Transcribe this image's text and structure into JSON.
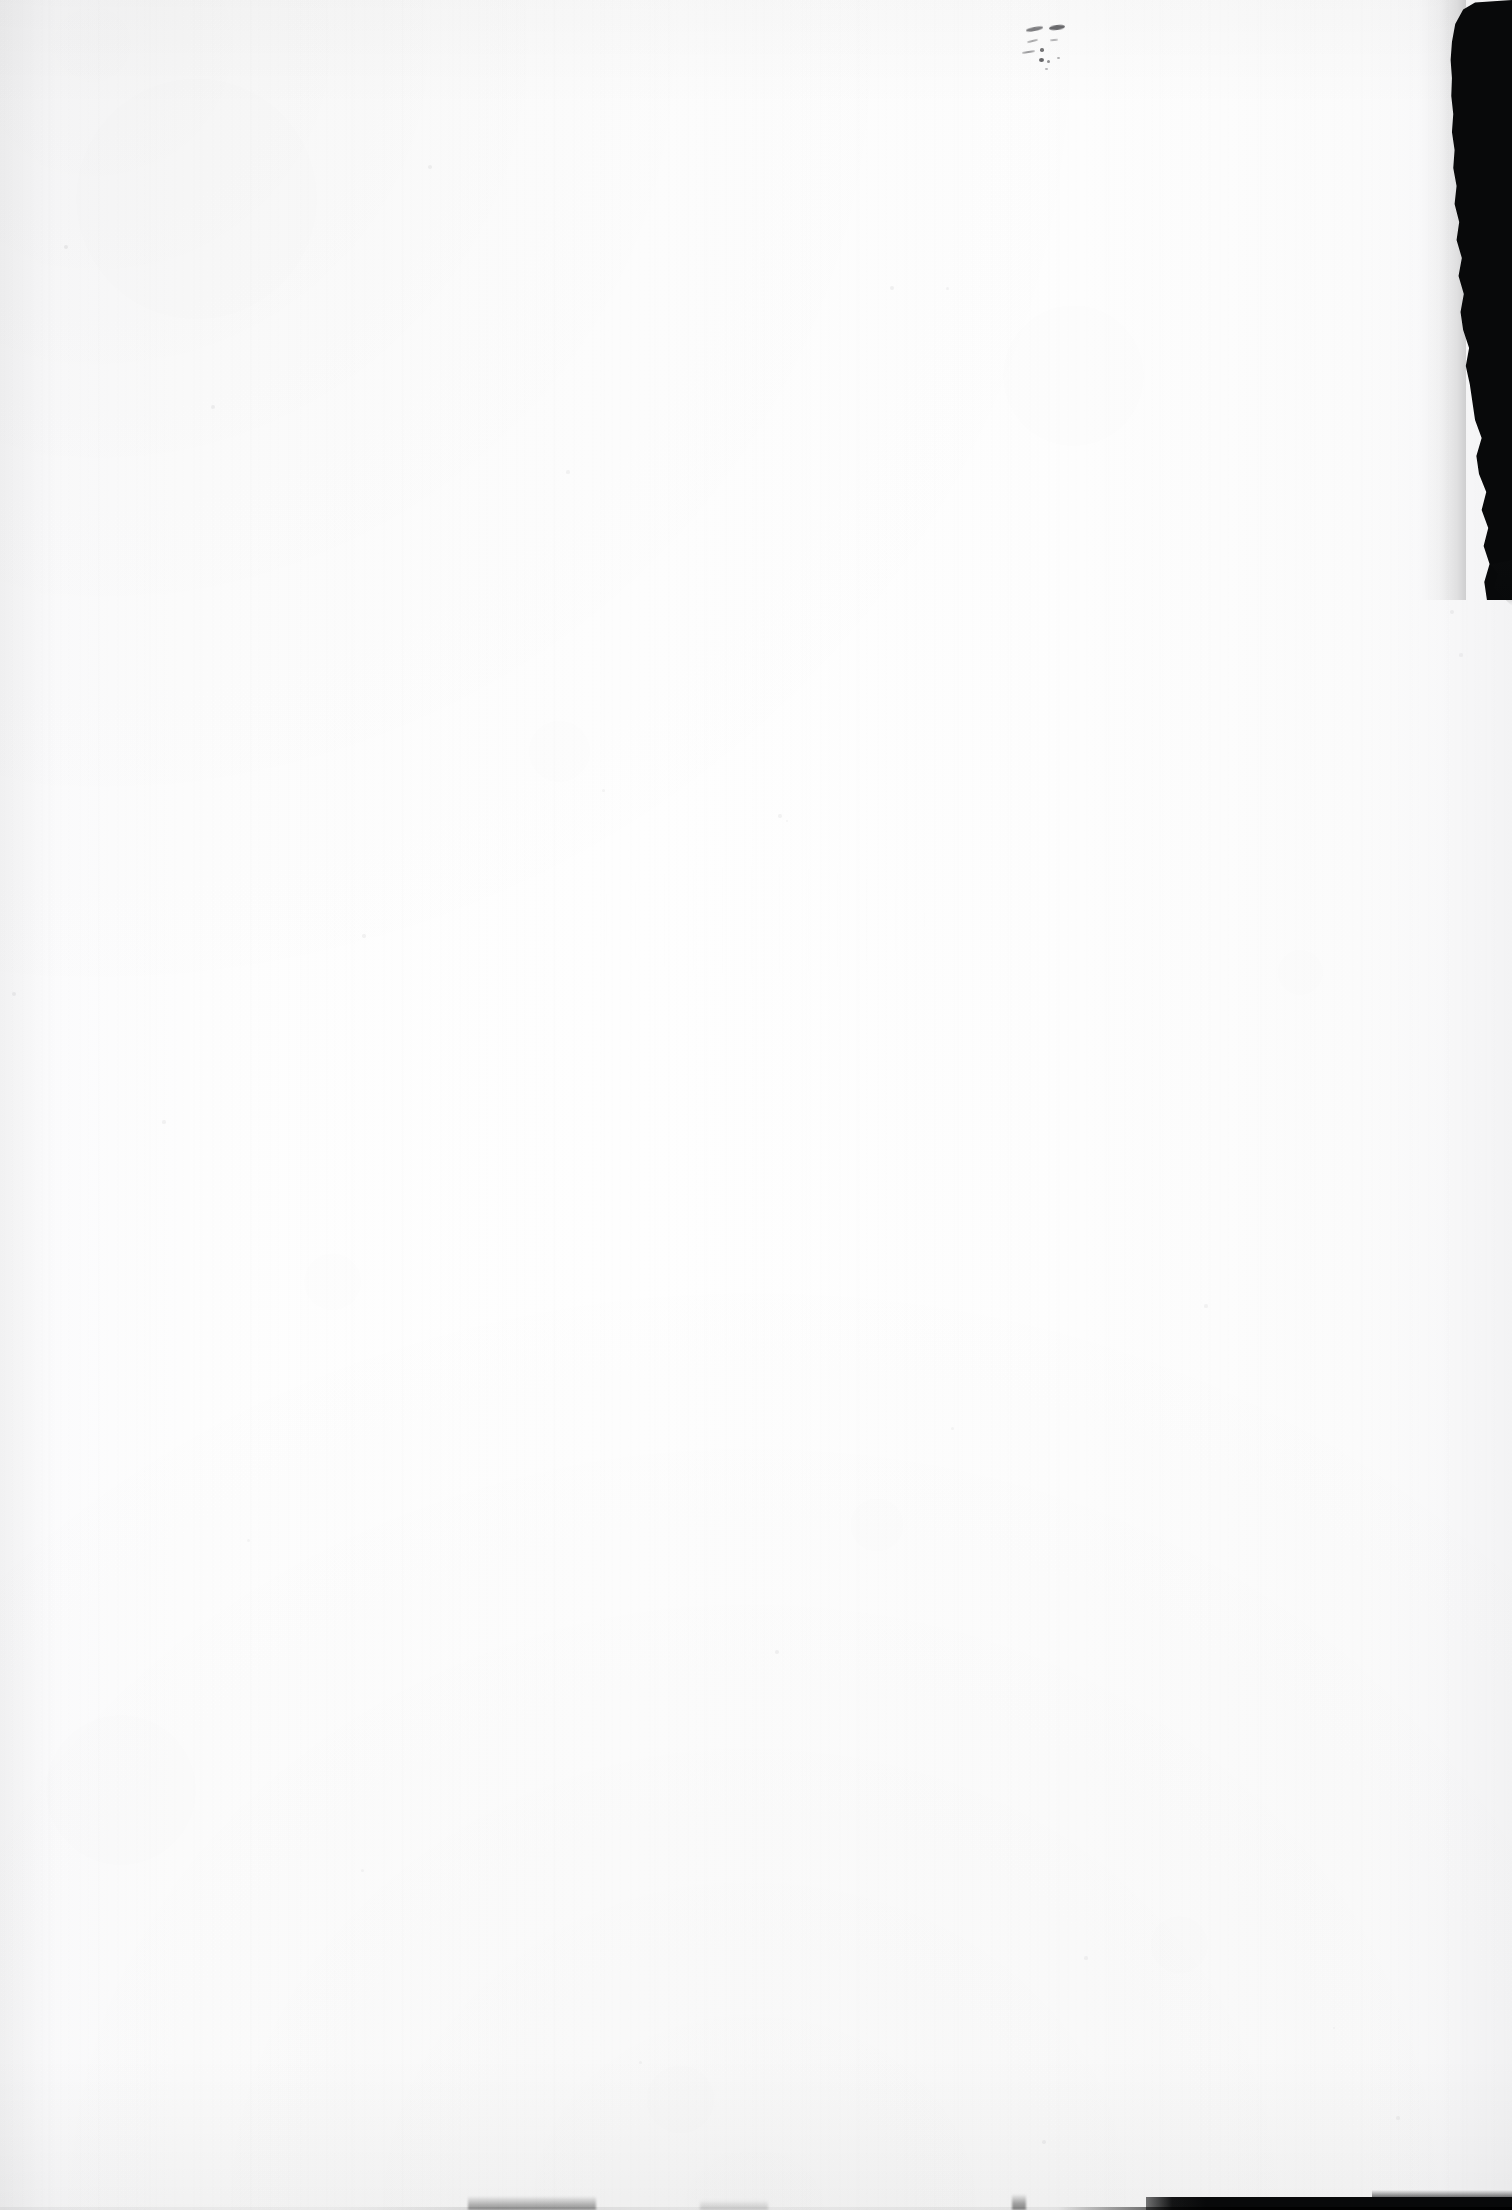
{
  "document": {
    "page_kind": "blank-scanned-leaf",
    "visible_text": "",
    "caption": "",
    "page_number": "",
    "notes": "No rendered text, headings, captions or page numbers are present in the pixels."
  },
  "canvas": {
    "width": 1512,
    "height": 2210
  },
  "colors": {
    "paper": "#fdfdfd",
    "paper_edge_shade": "#f7f7f8",
    "scanner_bed": "#08090a",
    "mark_ink": "#343438",
    "speck": "#5f5f64"
  },
  "regions": {
    "paper": {
      "name": "paper-sheet",
      "description": "Near-white scanned sheet occupying the full frame"
    },
    "scanner_bed_right": {
      "name": "scanner-bed-band-right",
      "description": "Black scanner background visible past the torn right paper edge",
      "x": 1446,
      "y": 0,
      "width": 66,
      "height": 600
    },
    "bottom_edge": {
      "name": "scanner-bed-strip-bottom",
      "description": "Dark scanner background strip along the bottom edge, solid toward the right",
      "y": 2197,
      "height": 13
    },
    "mark_cluster": {
      "name": "faint-pencil-marks",
      "description": "Small faint graphite / bleed-through specks near the top right of the sheet",
      "x": 1022,
      "y": 18,
      "width": 80,
      "height": 58,
      "count": 10
    }
  },
  "specks": [
    {
      "x": 66,
      "y": 247,
      "r": 2.4,
      "o": 0.34
    },
    {
      "x": 213,
      "y": 407,
      "r": 2.0,
      "o": 0.28
    },
    {
      "x": 430,
      "y": 167,
      "r": 1.8,
      "o": 0.26
    },
    {
      "x": 568,
      "y": 472,
      "r": 1.6,
      "o": 0.22
    },
    {
      "x": 892,
      "y": 288,
      "r": 1.9,
      "o": 0.27
    },
    {
      "x": 947,
      "y": 288,
      "r": 1.5,
      "o": 0.22
    },
    {
      "x": 780,
      "y": 816,
      "r": 1.7,
      "o": 0.24
    },
    {
      "x": 787,
      "y": 821,
      "r": 1.4,
      "o": 0.2
    },
    {
      "x": 603,
      "y": 790,
      "r": 1.5,
      "o": 0.2
    },
    {
      "x": 1452,
      "y": 612,
      "r": 2.1,
      "o": 0.26
    },
    {
      "x": 1461,
      "y": 655,
      "r": 1.6,
      "o": 0.22
    },
    {
      "x": 14,
      "y": 994,
      "r": 2.2,
      "o": 0.3
    },
    {
      "x": 164,
      "y": 1122,
      "r": 1.6,
      "o": 0.22
    },
    {
      "x": 364,
      "y": 936,
      "r": 1.7,
      "o": 0.24
    },
    {
      "x": 777,
      "y": 1652,
      "r": 1.9,
      "o": 0.26
    },
    {
      "x": 952,
      "y": 1428,
      "r": 1.5,
      "o": 0.2
    },
    {
      "x": 1206,
      "y": 1306,
      "r": 1.6,
      "o": 0.22
    },
    {
      "x": 1044,
      "y": 2142,
      "r": 1.8,
      "o": 0.25
    },
    {
      "x": 1398,
      "y": 2118,
      "r": 1.7,
      "o": 0.23
    },
    {
      "x": 362,
      "y": 1870,
      "r": 1.5,
      "o": 0.2
    },
    {
      "x": 1086,
      "y": 1958,
      "r": 1.6,
      "o": 0.22
    },
    {
      "x": 640,
      "y": 2062,
      "r": 1.5,
      "o": 0.2
    },
    {
      "x": 1334,
      "y": 2028,
      "r": 1.4,
      "o": 0.18
    },
    {
      "x": 248,
      "y": 1540,
      "r": 1.5,
      "o": 0.19
    }
  ]
}
